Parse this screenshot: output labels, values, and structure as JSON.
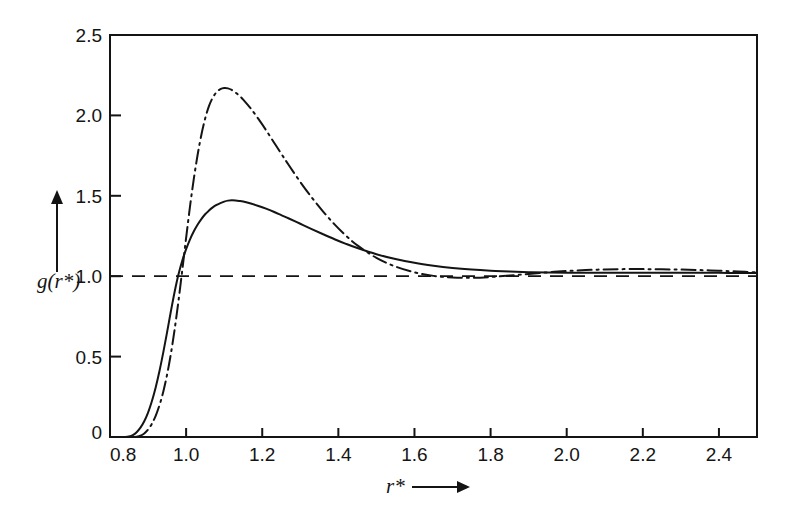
{
  "figure": {
    "background_color": "#ffffff",
    "foreground_color": "#141414",
    "frame": {
      "left": 110,
      "top": 35,
      "right": 757,
      "bottom": 437
    }
  },
  "axes": {
    "x": {
      "label": "r*",
      "label_arrow": "arrow-right",
      "min": 0.8,
      "max": 2.5,
      "tick_values": [
        0.8,
        1.0,
        1.2,
        1.4,
        1.6,
        1.8,
        2.0,
        2.2,
        2.4
      ],
      "tick_labels": [
        "0.8",
        "1.0",
        "1.2",
        "1.4",
        "1.6",
        "1.8",
        "2.0",
        "2.2",
        "2.4"
      ]
    },
    "y": {
      "label": "g(r*)",
      "label_arrow": "arrow-up",
      "min": 0.0,
      "max": 2.5,
      "tick_values": [
        0,
        0.5,
        1.0,
        1.5,
        2.0,
        2.5
      ],
      "tick_labels": [
        "0",
        "0.5",
        "1.0",
        "1.5",
        "2.0",
        "2.5"
      ]
    }
  },
  "chart_data": {
    "type": "line",
    "title": "",
    "subtitle": "",
    "xlabel": "r*",
    "ylabel": "g(r*)",
    "xlim": [
      0.8,
      2.5
    ],
    "ylim": [
      0.0,
      2.5
    ],
    "grid": false,
    "legend_position": "none",
    "xticks": [
      0.8,
      1.0,
      1.2,
      1.4,
      1.6,
      1.8,
      2.0,
      2.2,
      2.4
    ],
    "yticks": [
      0,
      0.5,
      1.0,
      1.5,
      2.0,
      2.5
    ],
    "annotations": [
      "solid curve peaks near r* = 1.11 at g = 1.47",
      "dash-dot curve peaks near r* = 1.09 at g = 2.17",
      "both curves cross g = 1.0 near r* = 0.995",
      "both curves relax toward g = 1.0 beyond r* = 1.8"
    ],
    "x": [
      0.8,
      0.82,
      0.84,
      0.85,
      0.86,
      0.87,
      0.88,
      0.89,
      0.9,
      0.91,
      0.92,
      0.93,
      0.94,
      0.95,
      0.96,
      0.97,
      0.98,
      0.99,
      1.0,
      1.01,
      1.02,
      1.03,
      1.04,
      1.05,
      1.06,
      1.07,
      1.08,
      1.09,
      1.1,
      1.11,
      1.12,
      1.13,
      1.14,
      1.15,
      1.17,
      1.19,
      1.21,
      1.23,
      1.25,
      1.27,
      1.3,
      1.33,
      1.36,
      1.39,
      1.42,
      1.45,
      1.5,
      1.55,
      1.6,
      1.65,
      1.7,
      1.75,
      1.8,
      1.85,
      1.9,
      1.95,
      2.0,
      2.05,
      2.1,
      2.15,
      2.2,
      2.25,
      2.3,
      2.35,
      2.4,
      2.45,
      2.5
    ],
    "series": [
      {
        "name": "solid-curve",
        "style": "solid",
        "color": "#141414",
        "linewidth": 2.0,
        "values": [
          0.0,
          0.0,
          0.0,
          0.003,
          0.012,
          0.03,
          0.058,
          0.098,
          0.152,
          0.222,
          0.308,
          0.41,
          0.526,
          0.652,
          0.782,
          0.905,
          1.012,
          1.098,
          1.168,
          1.228,
          1.278,
          1.32,
          1.355,
          1.385,
          1.408,
          1.428,
          1.443,
          1.455,
          1.464,
          1.47,
          1.472,
          1.471,
          1.468,
          1.464,
          1.452,
          1.437,
          1.42,
          1.401,
          1.38,
          1.359,
          1.326,
          1.293,
          1.261,
          1.23,
          1.201,
          1.175,
          1.137,
          1.107,
          1.083,
          1.065,
          1.051,
          1.041,
          1.034,
          1.029,
          1.025,
          1.023,
          1.022,
          1.021,
          1.021,
          1.021,
          1.021,
          1.021,
          1.021,
          1.021,
          1.021,
          1.02,
          1.02
        ]
      },
      {
        "name": "dash-dot-curve",
        "style": "dash-dot",
        "color": "#141414",
        "linewidth": 2.0,
        "values": [
          0.0,
          0.0,
          0.0,
          0.0,
          0.0,
          0.002,
          0.008,
          0.022,
          0.046,
          0.082,
          0.132,
          0.198,
          0.282,
          0.388,
          0.518,
          0.672,
          0.848,
          1.04,
          1.238,
          1.43,
          1.602,
          1.752,
          1.878,
          1.98,
          2.058,
          2.11,
          2.145,
          2.163,
          2.17,
          2.168,
          2.158,
          2.142,
          2.122,
          2.098,
          2.042,
          1.978,
          1.908,
          1.835,
          1.762,
          1.69,
          1.586,
          1.49,
          1.402,
          1.322,
          1.252,
          1.192,
          1.114,
          1.06,
          1.024,
          1.002,
          0.992,
          0.99,
          0.995,
          1.004,
          1.014,
          1.024,
          1.032,
          1.038,
          1.042,
          1.044,
          1.044,
          1.043,
          1.041,
          1.038,
          1.034,
          1.029,
          1.024
        ]
      }
    ],
    "reference_lines": [
      {
        "name": "unity-reference-line",
        "orientation": "horizontal",
        "value": 1.0,
        "style": "dashed",
        "color": "#141414"
      }
    ]
  }
}
